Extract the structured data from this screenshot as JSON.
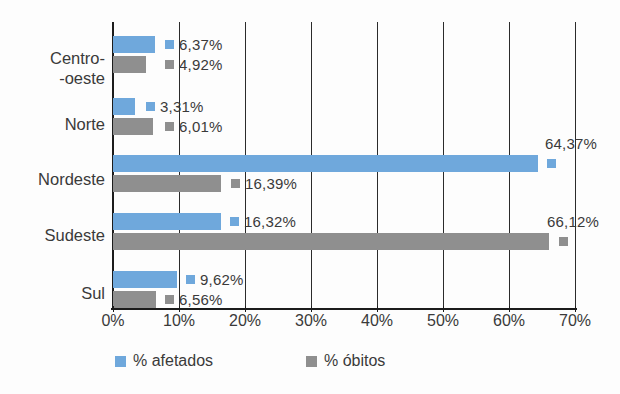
{
  "chart_data": {
    "type": "bar",
    "orientation": "horizontal",
    "title": "",
    "xlabel": "",
    "ylabel": "",
    "categories": [
      "Centro--oeste",
      "Norte",
      "Nordeste",
      "Sudeste",
      "Sul"
    ],
    "category_labels": [
      {
        "line1": "Centro-",
        "line2": "-oeste"
      },
      {
        "line1": "Norte",
        "line2": ""
      },
      {
        "line1": "Nordeste",
        "line2": ""
      },
      {
        "line1": "Sudeste",
        "line2": ""
      },
      {
        "line1": "Sul",
        "line2": ""
      }
    ],
    "series": [
      {
        "name": "% afetados",
        "color": "#6fa8dc",
        "values": [
          6.37,
          3.31,
          64.37,
          16.32,
          9.62
        ],
        "labels": [
          "6,37%",
          "3,31%",
          "64,37%",
          "16,32%",
          "9,62%"
        ]
      },
      {
        "name": "% óbitos",
        "color": "#8f8f8f",
        "values": [
          4.92,
          6.01,
          16.39,
          66.12,
          6.56
        ],
        "labels": [
          "4,92%",
          "6,01%",
          "16,39%",
          "66,12%",
          "6,56%"
        ]
      }
    ],
    "xlim": [
      0,
      70
    ],
    "xticks": [
      0,
      10,
      20,
      30,
      40,
      50,
      60,
      70
    ],
    "xtick_labels": [
      "0%",
      "10%",
      "20%",
      "30%",
      "40%",
      "50%",
      "60%",
      "70%"
    ],
    "grid": true,
    "grid_axis": "x",
    "legend_position": "bottom",
    "legend": [
      {
        "label": "% afetados",
        "color": "#6fa8dc"
      },
      {
        "label": "% óbitos",
        "color": "#8f8f8f"
      }
    ]
  }
}
